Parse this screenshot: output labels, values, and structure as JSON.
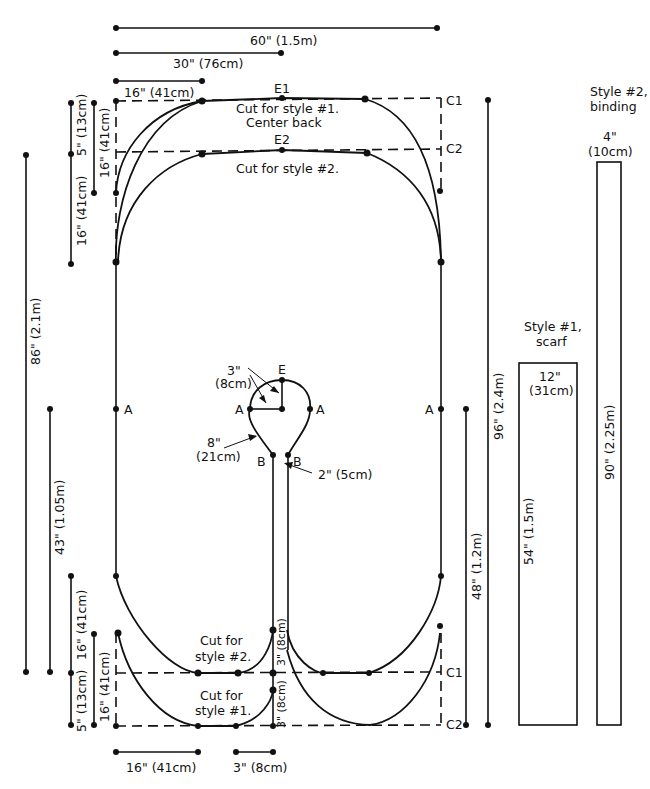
{
  "diagram": {
    "type": "sewing-pattern",
    "colors": {
      "line": "#111111",
      "background": "#ffffff"
    },
    "top_dimensions": {
      "full_width": "60\" (1.5m)",
      "half_width": "30\" (76cm)",
      "corner_width": "16\" (41cm)"
    },
    "left_dimensions": {
      "overall_length": "86\" (2.1m)",
      "half_length": "43\" (1.05m)",
      "top_offset": "5\" (13cm)",
      "top_curve_outer": "16\" (41cm)",
      "top_curve_inner": "16\" (41cm)",
      "bottom_curve_outer": "16\" (41cm)",
      "bottom_curve_inner": "16\" (41cm)",
      "bottom_offset": "5\" (13cm)"
    },
    "bottom_dimensions": {
      "corner_width": "16\" (41cm)",
      "center_gap": "3\" (8cm)"
    },
    "right_dimensions": {
      "overall_length": "96\" (2.4m)",
      "lower_length": "48\" (1.2m)"
    },
    "labels": {
      "e1": "E1",
      "e2": "E2",
      "c1_top": "C1",
      "c2_top": "C2",
      "c1_bottom": "C1",
      "c2_bottom": "C2",
      "cut_style1_top": "Cut for style #1.",
      "center_back": "Center back",
      "cut_style2_top": "Cut for style #2.",
      "cut_for_a": "Cut for",
      "style2_bottom": "style #2.",
      "cut_for_b": "Cut for",
      "style1_bottom": "style #1.",
      "a_left": "A",
      "a_neck_left": "A",
      "a_neck_right": "A",
      "a_right": "A",
      "e_neck": "E",
      "b_left": "B",
      "b_right": "B",
      "stem_upper": "3\" (8cm)",
      "stem_lower": "3\" (8cm)"
    },
    "neck_annotations": {
      "radius_value": "3\"",
      "radius_metric": "(8cm)",
      "curve_value": "8\"",
      "curve_metric": "(21cm)",
      "gap": "2\" (5cm)"
    },
    "scarf": {
      "title_line1": "Style #1,",
      "title_line2": "scarf",
      "width_value": "12\"",
      "width_metric": "(31cm)",
      "length": "54\" (1.5m)"
    },
    "binding": {
      "title_line1": "Style #2,",
      "title_line2": "binding",
      "width_value": "4\"",
      "width_metric": "(10cm)",
      "length": "90\" (2.25m)"
    }
  }
}
